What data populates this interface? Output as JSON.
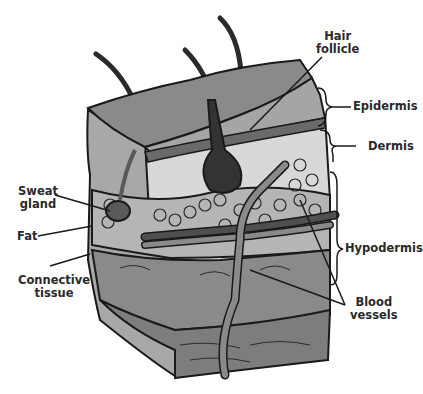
{
  "diagram": {
    "labels": {
      "hair_follicle": [
        "Hair",
        "follicle"
      ],
      "epidermis": "Epidermis",
      "dermis": "Dermis",
      "sweat_gland": [
        "Sweat",
        "gland"
      ],
      "fat": "Fat",
      "connective_tissue": [
        "Connective",
        "tissue"
      ],
      "hypodermis": "Hypodermis",
      "blood_vessels": [
        "Blood",
        "vessels"
      ]
    },
    "colors": {
      "epidermis_top": "#8a8a8a",
      "epidermis_side": "#a0a0a0",
      "dermis": "#d6d6d6",
      "fat_cells": "#b8b8b8",
      "connective": "#7a7a7a",
      "follicle": "#333333",
      "vessel_dark": "#555555",
      "vessel_light": "#8c8c8c",
      "outline": "#1a1a1a",
      "text": "#2a2a2a"
    }
  }
}
